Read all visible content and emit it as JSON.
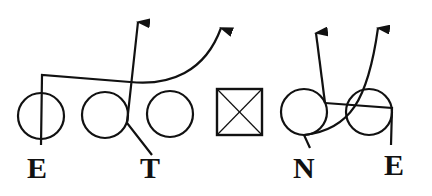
{
  "diagram": {
    "type": "football-play-diagram",
    "colors": {
      "stroke": "#111111",
      "background": "#ffffff"
    },
    "players": [
      {
        "id": "left-end",
        "label": "E",
        "shape": "circle",
        "position": "left end"
      },
      {
        "id": "left-tackle",
        "label": "T",
        "shape": "circle",
        "position": "left tackle"
      },
      {
        "id": "lineman-3",
        "label": "",
        "shape": "circle",
        "position": "guard"
      },
      {
        "id": "center",
        "label": "",
        "shape": "crossed-square",
        "position": "center"
      },
      {
        "id": "nose",
        "label": "N",
        "shape": "circle",
        "position": "nose"
      },
      {
        "id": "right-end",
        "label": "E",
        "shape": "circle",
        "position": "right end"
      }
    ],
    "labels": {
      "left_end": "E",
      "tackle": "T",
      "nose": "N",
      "right_end": "E"
    },
    "routes": [
      {
        "from": "left-end",
        "description": "up, across, curves upward to arrow"
      },
      {
        "from": "left-tackle",
        "description": "diagonal up to arrow"
      },
      {
        "from": "nose",
        "description": "curve right and upward to arrow"
      },
      {
        "from": "right-end",
        "description": "up, across left, then upward to arrow"
      }
    ]
  }
}
